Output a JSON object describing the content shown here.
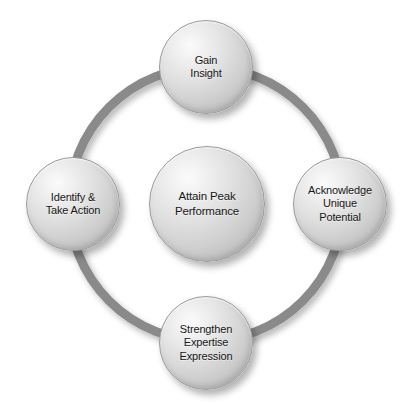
{
  "diagram": {
    "type": "cycle-with-hub",
    "background_color": "#ffffff",
    "ring": {
      "color": "#8a8a8a",
      "center_x": 206,
      "center_y": 204,
      "radius": 137,
      "stroke_width": 9
    },
    "node_fill_light": "#fbfbfb",
    "node_fill_dark": "#b2b2b2",
    "node_border_color": "#9a9a9a",
    "text_color": "#161616",
    "center_node": {
      "id": "attain-peak-performance",
      "label": "Attain Peak\nPerformance",
      "diameter": 116
    },
    "outer_nodes": [
      {
        "id": "gain-insight",
        "position": "top",
        "label": "Gain\nInsight",
        "diameter": 94
      },
      {
        "id": "acknowledge-unique-potential",
        "position": "right",
        "label": "Acknowledge\nUnique\nPotential",
        "diameter": 94
      },
      {
        "id": "strengthen-expertise-expression",
        "position": "bottom",
        "label": "Strengthen\nExpertise\nExpression",
        "diameter": 94
      },
      {
        "id": "identify-take-action",
        "position": "left",
        "label": "Identify &\nTake Action",
        "diameter": 94
      }
    ]
  }
}
